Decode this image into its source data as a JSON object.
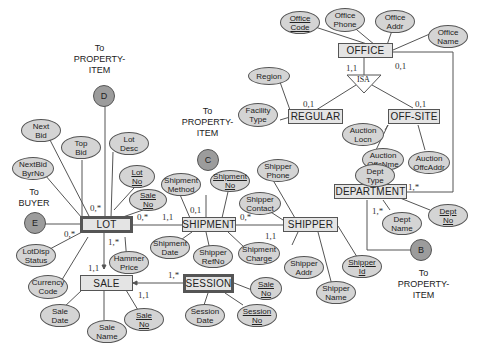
{
  "entities": {
    "office": "OFFICE",
    "regular": "REGULAR",
    "offsite": "OFF-SITE",
    "department": "DEPARTMENT",
    "lot": "LOT",
    "shipment": "SHIPMENT",
    "shipper": "SHIPPER",
    "sale": "SALE",
    "session": "SESSION"
  },
  "isa": "ISA",
  "attributes": {
    "office_code": [
      "Office",
      "Code"
    ],
    "office_phone": [
      "Office",
      "Phone"
    ],
    "office_addr": [
      "Office",
      "Addr"
    ],
    "office_name": [
      "Office",
      "Name"
    ],
    "region": [
      "Region"
    ],
    "facility_type": [
      "Facility",
      "Type"
    ],
    "auction_locn": [
      "Auction",
      "Locn"
    ],
    "auction_offcnme": [
      "Auction",
      "OffcNme"
    ],
    "auction_offcaddr": [
      "Auction",
      "OffcAddr"
    ],
    "dept_type": [
      "Dept",
      "Type"
    ],
    "dept_name": [
      "Dept",
      "Name"
    ],
    "dept_no": [
      "Dept",
      "No"
    ],
    "next_bid": [
      "Next",
      "Bid"
    ],
    "top_bid": [
      "Top",
      "Bid"
    ],
    "lot_desc": [
      "Lot",
      "Desc"
    ],
    "nextbid_byrno": [
      "NextBid",
      "ByrNo"
    ],
    "lot_no": [
      "Lot",
      "No"
    ],
    "lot_sale_no": [
      "Sale",
      "No"
    ],
    "lotdisp_status": [
      "LotDisp",
      "Status"
    ],
    "currency_code": [
      "Currency",
      "Code"
    ],
    "hammer_price": [
      "Hammer",
      "Price"
    ],
    "shipment_method": [
      "Shipment",
      "Method"
    ],
    "shipment_no": [
      "Shipment",
      "No"
    ],
    "shipment_date": [
      "Shipment",
      "Date"
    ],
    "shipper_refno": [
      "Shipper",
      "RefNo"
    ],
    "shipment_charge": [
      "Shipment",
      "Charge"
    ],
    "shipper_phone": [
      "Shipper",
      "Phone"
    ],
    "shipper_contact": [
      "Shipper",
      "Contact"
    ],
    "shipper_addr": [
      "Shipper",
      "Addr"
    ],
    "shipper_name": [
      "Shipper",
      "Name"
    ],
    "shipper_id": [
      "Shipper",
      "Id"
    ],
    "sale_date": [
      "Sale",
      "Date"
    ],
    "sale_name": [
      "Sale",
      "Name"
    ],
    "sale_no": [
      "Sale",
      "No"
    ],
    "session_sale_no": [
      "Sale",
      "No"
    ],
    "session_date": [
      "Session",
      "Date"
    ],
    "session_no": [
      "Session",
      "No"
    ]
  },
  "connectors": {
    "b": "B",
    "c": "C",
    "d": "D",
    "e": "E"
  },
  "notes": {
    "to_property_item_d": [
      "To",
      "PROPERTY-",
      "ITEM"
    ],
    "to_property_item_c": [
      "To",
      "PROPERTY-",
      "ITEM"
    ],
    "to_property_item_b": [
      "To",
      "PROPERTY-",
      "ITEM"
    ],
    "to_buyer": [
      "To",
      "BUYER"
    ]
  },
  "cardinalities": {
    "office_isa": "1,1",
    "office_dept": "0,1",
    "isa_regular": "0,1",
    "isa_offsite": "0,1",
    "dept_office": "1,*",
    "dept_b": "1,*",
    "lot_d": "0,*",
    "lot_e": "0,*",
    "lot_shipment": "0,*",
    "shipment_lot": "1,1",
    "shipment_c": "0,1",
    "shipper_shipment": "0,*",
    "shipment_shipper": "1,1",
    "lot_sale": "1,*",
    "sale_lot": "1,1",
    "session_sale": "1,*",
    "sale_session": "1,1"
  }
}
